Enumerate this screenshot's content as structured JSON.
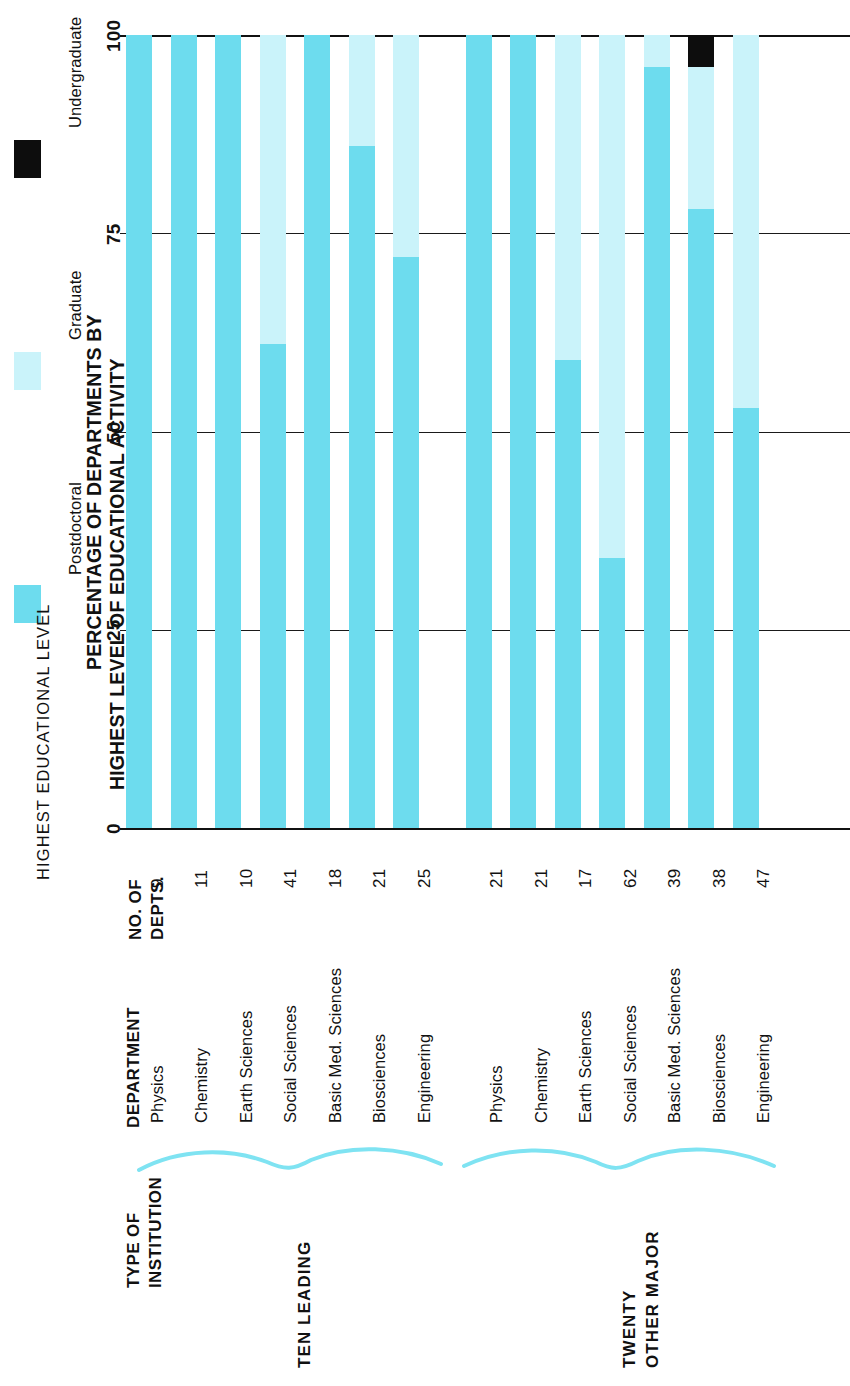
{
  "figure": {
    "axis_title_line1": "PERCENTAGE OF DEPARTMENTS BY",
    "axis_title_line2": "HIGHEST LEVEL OF EDUCATIONAL ACTIVITY",
    "legend_title": "HIGHEST EDUCATIONAL LEVEL"
  },
  "legend": {
    "items": [
      {
        "label": "Postdoctoral",
        "color": "#6ddcee"
      },
      {
        "label": "Graduate",
        "color": "#caf3fa"
      },
      {
        "label": "Undergraduate",
        "color": "#0d0d0d"
      }
    ]
  },
  "columns": {
    "institution": "TYPE OF\nINSTITUTION",
    "institution_line1": "TYPE OF",
    "institution_line2": "INSTITUTION",
    "department": "DEPARTMENT",
    "depts_line1": "NO. OF",
    "depts_line2": "DEPTS."
  },
  "groups": [
    {
      "name": "TEN LEADING",
      "line1": "TEN LEADING",
      "line2": ""
    },
    {
      "name": "TWENTY OTHER MAJOR",
      "line1": "TWENTY",
      "line2": "OTHER MAJOR"
    }
  ],
  "chart_data": {
    "type": "bar",
    "orientation": "vertical-stacked-printed-sideways",
    "xlabel": "DEPARTMENT",
    "ylabel": "PERCENTAGE OF DEPARTMENTS BY HIGHEST LEVEL OF EDUCATIONAL ACTIVITY",
    "ylim": [
      0,
      100
    ],
    "yticks": [
      0,
      25,
      50,
      75,
      100
    ],
    "ytick_labels": [
      "0",
      "25",
      "50",
      "75",
      "100"
    ],
    "grid": true,
    "legend_position": "top",
    "series": [
      {
        "name": "Postdoctoral",
        "color": "#6ddcee"
      },
      {
        "name": "Graduate",
        "color": "#caf3fa"
      },
      {
        "name": "Undergraduate",
        "color": "#0d0d0d"
      }
    ],
    "categories": [
      "Physics",
      "Chemistry",
      "Earth Sciences",
      "Social Sciences",
      "Basic Med. Sciences",
      "Biosciences",
      "Engineering",
      "Physics",
      "Chemistry",
      "Earth Sciences",
      "Social Sciences",
      "Basic Med. Sciences",
      "Biosciences",
      "Engineering"
    ],
    "rows": [
      {
        "group": "TEN LEADING",
        "department": "Physics",
        "depts": "9",
        "postdoctoral": 100,
        "graduate": 0,
        "undergraduate": 0
      },
      {
        "group": "TEN LEADING",
        "department": "Chemistry",
        "depts": "11",
        "postdoctoral": 100,
        "graduate": 0,
        "undergraduate": 0
      },
      {
        "group": "TEN LEADING",
        "department": "Earth Sciences",
        "depts": "10",
        "postdoctoral": 100,
        "graduate": 0,
        "undergraduate": 0
      },
      {
        "group": "TEN LEADING",
        "department": "Social Sciences",
        "depts": "41",
        "postdoctoral": 61,
        "graduate": 39,
        "undergraduate": 0
      },
      {
        "group": "TEN LEADING",
        "department": "Basic Med. Sciences",
        "depts": "18",
        "postdoctoral": 100,
        "graduate": 0,
        "undergraduate": 0
      },
      {
        "group": "TEN LEADING",
        "department": "Biosciences",
        "depts": "21",
        "postdoctoral": 86,
        "graduate": 14,
        "undergraduate": 0
      },
      {
        "group": "TEN LEADING",
        "department": "Engineering",
        "depts": "25",
        "postdoctoral": 72,
        "graduate": 28,
        "undergraduate": 0
      },
      {
        "group": "TWENTY OTHER MAJOR",
        "department": "Physics",
        "depts": "21",
        "postdoctoral": 100,
        "graduate": 0,
        "undergraduate": 0
      },
      {
        "group": "TWENTY OTHER MAJOR",
        "department": "Chemistry",
        "depts": "21",
        "postdoctoral": 100,
        "graduate": 0,
        "undergraduate": 0
      },
      {
        "group": "TWENTY OTHER MAJOR",
        "department": "Earth Sciences",
        "depts": "17",
        "postdoctoral": 59,
        "graduate": 41,
        "undergraduate": 0
      },
      {
        "group": "TWENTY OTHER MAJOR",
        "department": "Social Sciences",
        "depts": "62",
        "postdoctoral": 34,
        "graduate": 66,
        "undergraduate": 0
      },
      {
        "group": "TWENTY OTHER MAJOR",
        "department": "Basic Med. Sciences",
        "depts": "39",
        "postdoctoral": 96,
        "graduate": 4,
        "undergraduate": 0
      },
      {
        "group": "TWENTY OTHER MAJOR",
        "department": "Biosciences",
        "depts": "38",
        "postdoctoral": 78,
        "graduate": 18,
        "undergraduate": 4
      },
      {
        "group": "TWENTY OTHER MAJOR",
        "department": "Engineering",
        "depts": "47",
        "postdoctoral": 53,
        "graduate": 47,
        "undergraduate": 0
      }
    ]
  }
}
